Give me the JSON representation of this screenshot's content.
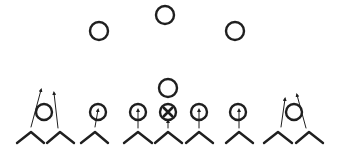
{
  "diagram": {
    "title": "Football play formation diagram",
    "stroke_color": "#1f1f1f",
    "background": "#ffffff",
    "defense": [
      {
        "id": "defender-left",
        "shape": "circle",
        "cx": 99,
        "cy": 31,
        "r": 9
      },
      {
        "id": "defender-middle",
        "shape": "circle",
        "cx": 165,
        "cy": 15,
        "r": 9
      },
      {
        "id": "defender-right",
        "shape": "circle",
        "cx": 235,
        "cy": 31,
        "r": 9
      },
      {
        "id": "defender-center",
        "shape": "circle",
        "cx": 168,
        "cy": 88,
        "r": 9
      }
    ],
    "offense": [
      {
        "id": "player-1",
        "cx": 44,
        "cy": 112,
        "r": 8,
        "marked": false
      },
      {
        "id": "player-2",
        "cx": 98,
        "cy": 112,
        "r": 8,
        "marked": false
      },
      {
        "id": "player-3",
        "cx": 138,
        "cy": 112,
        "r": 8,
        "marked": false
      },
      {
        "id": "player-4-ball",
        "cx": 168,
        "cy": 112,
        "r": 8,
        "marked": true,
        "mark": "X"
      },
      {
        "id": "player-5",
        "cx": 199,
        "cy": 112,
        "r": 8,
        "marked": false
      },
      {
        "id": "player-6",
        "cx": 238,
        "cy": 112,
        "r": 8,
        "marked": false
      },
      {
        "id": "player-7",
        "cx": 294,
        "cy": 112,
        "r": 8,
        "marked": false
      }
    ],
    "blockers": [
      {
        "id": "chevron-1",
        "apex_x": 31,
        "left_x": 17,
        "right_x": 44
      },
      {
        "id": "chevron-2",
        "apex_x": 60,
        "left_x": 47,
        "right_x": 74
      },
      {
        "id": "chevron-3",
        "apex_x": 95,
        "left_x": 81,
        "right_x": 108
      },
      {
        "id": "chevron-4",
        "apex_x": 138,
        "left_x": 124,
        "right_x": 152
      },
      {
        "id": "chevron-5",
        "apex_x": 168,
        "left_x": 155,
        "right_x": 182
      },
      {
        "id": "chevron-6",
        "apex_x": 199,
        "left_x": 186,
        "right_x": 213
      },
      {
        "id": "chevron-7",
        "apex_x": 239,
        "left_x": 226,
        "right_x": 253
      },
      {
        "id": "chevron-8",
        "apex_x": 278,
        "left_x": 264,
        "right_x": 292
      },
      {
        "id": "chevron-9",
        "apex_x": 309,
        "left_x": 296,
        "right_x": 323
      }
    ],
    "chevron_apex_y": 132,
    "chevron_base_y": 143,
    "routes": [
      {
        "id": "route-1a",
        "from": [
          31,
          127
        ],
        "to": [
          41,
          90
        ]
      },
      {
        "id": "route-1b",
        "from": [
          58,
          128
        ],
        "to": [
          54,
          93
        ]
      },
      {
        "id": "route-3",
        "from": [
          95,
          127
        ],
        "to": [
          98,
          110
        ]
      },
      {
        "id": "route-4",
        "from": [
          138,
          128
        ],
        "to": [
          138,
          110
        ]
      },
      {
        "id": "route-5",
        "from": [
          168,
          128
        ],
        "to": [
          168,
          121
        ]
      },
      {
        "id": "route-6",
        "from": [
          199,
          128
        ],
        "to": [
          199,
          110
        ]
      },
      {
        "id": "route-7",
        "from": [
          239,
          128
        ],
        "to": [
          239,
          110
        ]
      },
      {
        "id": "route-8a",
        "from": [
          281,
          127
        ],
        "to": [
          285,
          99
        ]
      },
      {
        "id": "route-8b",
        "from": [
          306,
          128
        ],
        "to": [
          297,
          95
        ]
      }
    ]
  }
}
